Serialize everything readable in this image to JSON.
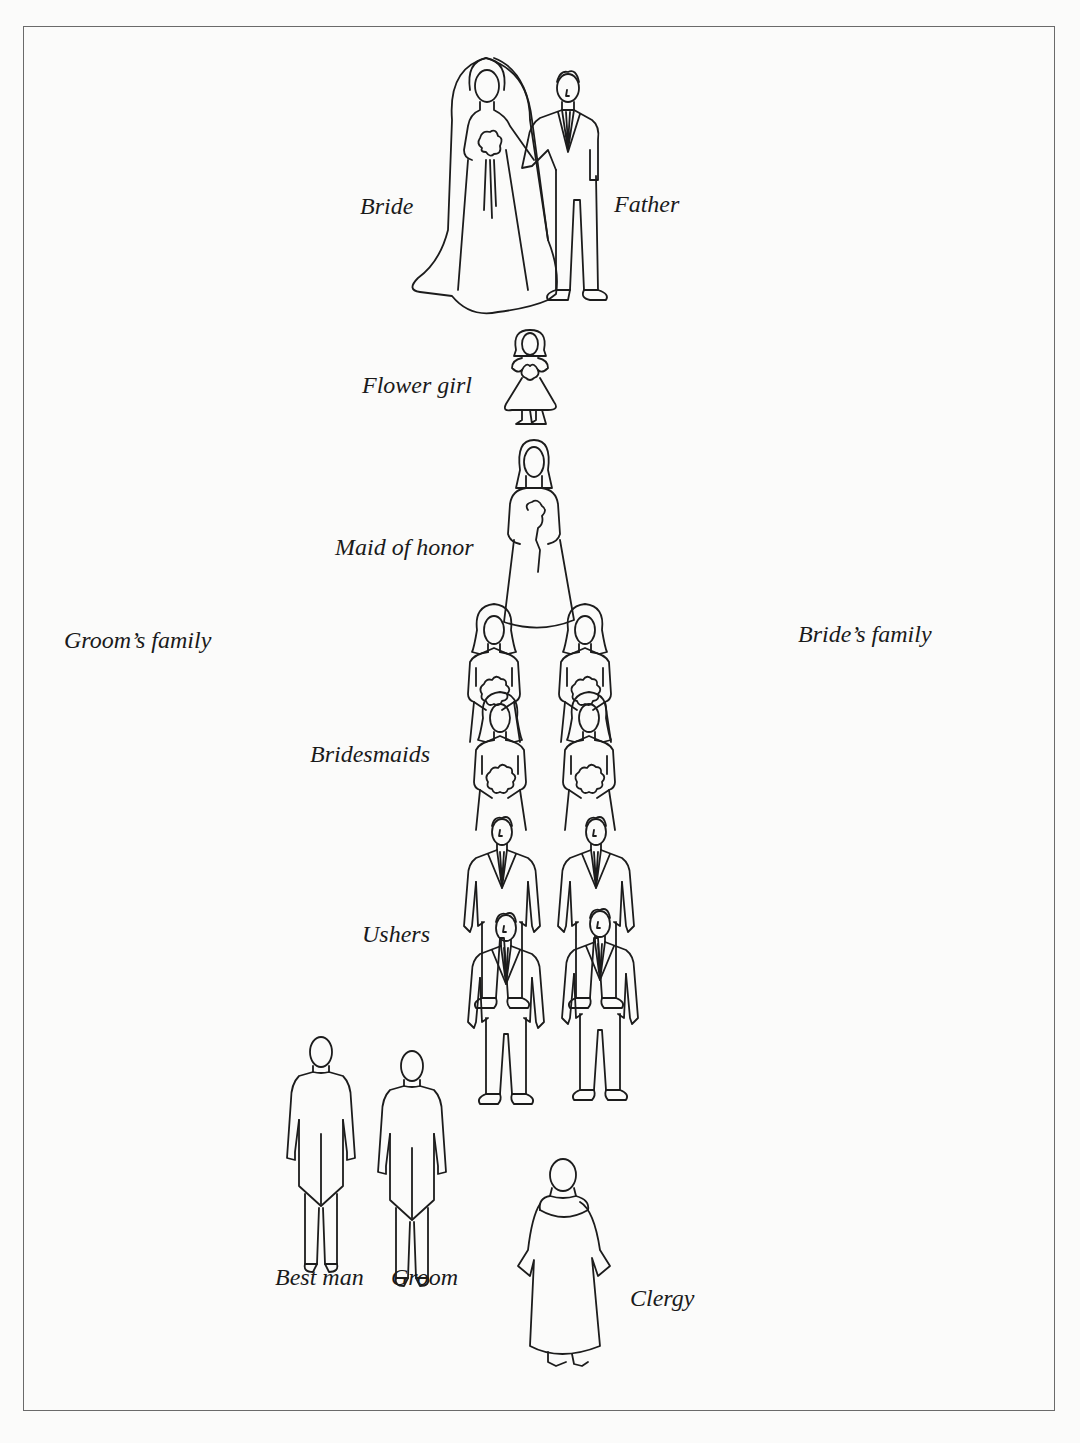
{
  "diagram": {
    "colors": {
      "background": "#fbfbfa",
      "line": "#1c1c1c",
      "frame": "#6a6a6a"
    },
    "labels": {
      "bride": "Bride",
      "father": "Father",
      "flower_girl": "Flower girl",
      "maid_of_honor": "Maid of honor",
      "grooms_family": "Groom’s family",
      "brides_family": "Bride’s family",
      "bridesmaids": "Bridesmaids",
      "ushers": "Ushers",
      "best_man": "Best man",
      "groom": "Groom",
      "clergy": "Clergy"
    },
    "nodes": [
      {
        "id": "bride",
        "label": "Bride",
        "count": 1,
        "order": 1
      },
      {
        "id": "father",
        "label": "Father",
        "count": 1,
        "order": 1
      },
      {
        "id": "flower_girl",
        "label": "Flower girl",
        "count": 1,
        "order": 2
      },
      {
        "id": "maid_of_honor",
        "label": "Maid of honor",
        "count": 1,
        "order": 3
      },
      {
        "id": "bridesmaids",
        "label": "Bridesmaids",
        "count": 4,
        "order": 4
      },
      {
        "id": "ushers",
        "label": "Ushers",
        "count": 4,
        "order": 5
      },
      {
        "id": "best_man",
        "label": "Best man",
        "count": 1,
        "order": 6
      },
      {
        "id": "groom",
        "label": "Groom",
        "count": 1,
        "order": 6
      },
      {
        "id": "clergy",
        "label": "Clergy",
        "count": 1,
        "order": 6
      }
    ],
    "sides": {
      "left": "Groom’s family",
      "right": "Bride’s family"
    }
  }
}
